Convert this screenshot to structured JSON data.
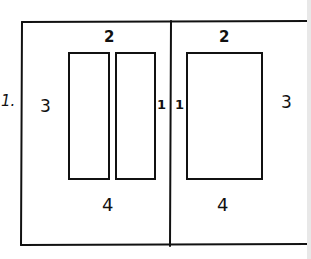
{
  "diagram": {
    "type": "two-page spread margin layout sketch",
    "stray_mark": "1.",
    "left_page": {
      "top_margin": "2",
      "outer_margin": "3",
      "inner_margin": "1",
      "bottom_margin": "4",
      "columns": 2
    },
    "right_page": {
      "top_margin": "2",
      "outer_margin": "3",
      "inner_margin": "1",
      "bottom_margin": "4",
      "columns": 1
    },
    "colors": {
      "ink": "#111111",
      "paper": "#ffffff"
    }
  }
}
